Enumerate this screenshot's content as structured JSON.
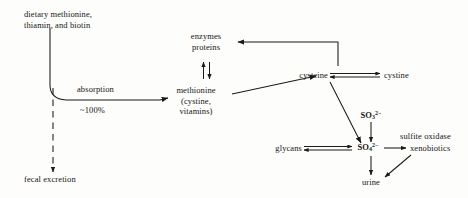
{
  "diagram": {
    "stroke_color": "#1a1a1a",
    "background_color": "#fdfdfb",
    "nodes": {
      "dietary": {
        "line1": "dietary methionine,",
        "line2": "thiamin, and biotin"
      },
      "fecal_excretion": {
        "label": "fecal excretion"
      },
      "enzymes_proteins": {
        "line1": "enzymes",
        "line2": "proteins"
      },
      "methionine": {
        "line1": "methionine",
        "line2": "(cystine,",
        "line3": "vitamins)"
      },
      "cysteine": {
        "label": "cysteine"
      },
      "cystine": {
        "label": "cystine"
      },
      "glycans": {
        "label": "glycans"
      },
      "xenobiotics": {
        "label": "xenobiotics"
      },
      "urine": {
        "label": "urine"
      },
      "sulfite": {
        "base": "SO",
        "subscript": "3",
        "superscript": "2−"
      },
      "sulfate": {
        "base": "SO",
        "subscript": "4",
        "superscript": "2−"
      }
    },
    "edge_labels": {
      "absorption": "absorption",
      "absorption_pct": "~100%",
      "sulfite_oxidase": "sulfite oxidase"
    }
  }
}
